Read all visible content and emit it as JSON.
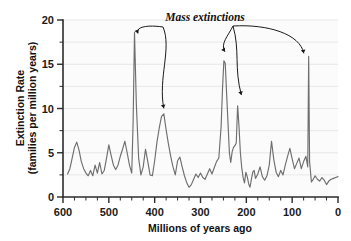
{
  "chart_data": {
    "type": "line",
    "title": "",
    "xlabel": "Millions of years ago",
    "ylabel": "Extinction Rate\n(families per million years)",
    "ylabel_line1": "Extinction Rate",
    "ylabel_line2": "(families per million years)",
    "xlim": [
      600,
      0
    ],
    "ylim": [
      0,
      20
    ],
    "x_reversed": true,
    "grid": "horizontal-minor",
    "legend": "none",
    "x_ticks_major": [
      600,
      500,
      400,
      300,
      200,
      100,
      0
    ],
    "x_tick_labels": [
      "600",
      "500",
      "400",
      "300",
      "200",
      "100",
      "0"
    ],
    "x_tick_minor_step": 25,
    "y_ticks_major": [
      0,
      5,
      10,
      15,
      20
    ],
    "y_tick_labels": [
      "0",
      "5",
      "10",
      "15",
      "20"
    ],
    "y_tick_minor_step": 2.5,
    "series_name": "Extinction rate",
    "line_color": "#6e6e6e",
    "x": [
      590,
      585,
      580,
      575,
      570,
      565,
      560,
      555,
      550,
      545,
      540,
      535,
      530,
      525,
      520,
      515,
      510,
      505,
      500,
      495,
      490,
      485,
      480,
      475,
      470,
      465,
      460,
      455,
      450,
      447,
      444,
      440,
      435,
      430,
      425,
      420,
      415,
      410,
      405,
      400,
      395,
      390,
      385,
      380,
      375,
      370,
      365,
      360,
      355,
      350,
      345,
      340,
      335,
      330,
      325,
      320,
      315,
      310,
      305,
      300,
      295,
      290,
      285,
      280,
      275,
      270,
      265,
      260,
      255,
      252,
      249,
      246,
      243,
      240,
      237,
      234,
      231,
      228,
      225,
      222,
      219,
      216,
      213,
      210,
      207,
      204,
      201,
      198,
      195,
      192,
      189,
      186,
      183,
      180,
      175,
      170,
      165,
      160,
      155,
      150,
      145,
      140,
      135,
      130,
      125,
      120,
      115,
      110,
      105,
      100,
      95,
      90,
      85,
      80,
      75,
      70,
      66,
      64,
      62,
      58,
      54,
      50,
      45,
      40,
      35,
      30,
      25,
      20,
      15,
      10,
      5,
      0
    ],
    "y": [
      2.6,
      3.2,
      4.4,
      5.6,
      6.2,
      5.3,
      4.0,
      3.2,
      2.7,
      2.4,
      3.0,
      2.4,
      3.6,
      2.7,
      3.9,
      2.6,
      3.0,
      4.4,
      5.9,
      4.7,
      3.6,
      3.1,
      3.6,
      4.6,
      5.4,
      6.3,
      5.0,
      3.6,
      2.7,
      8.5,
      18.6,
      10.5,
      4.4,
      2.5,
      3.4,
      5.4,
      4.0,
      2.5,
      2.4,
      4.1,
      6.2,
      7.8,
      9.1,
      9.4,
      7.6,
      6.0,
      4.6,
      3.4,
      2.5,
      4.1,
      4.5,
      3.4,
      2.4,
      1.6,
      1.1,
      1.4,
      2.0,
      2.6,
      2.2,
      2.7,
      2.2,
      2.0,
      2.6,
      3.2,
      2.6,
      3.3,
      4.0,
      4.4,
      8.0,
      12.2,
      15.4,
      15.1,
      11.6,
      8.4,
      5.0,
      3.9,
      5.1,
      5.6,
      5.8,
      6.1,
      10.3,
      8.0,
      5.0,
      3.3,
      2.2,
      1.6,
      2.8,
      2.3,
      1.5,
      1.1,
      2.0,
      2.8,
      3.0,
      2.1,
      2.6,
      3.4,
      2.3,
      1.9,
      2.4,
      3.6,
      6.3,
      4.2,
      2.8,
      2.3,
      3.0,
      2.5,
      3.6,
      4.6,
      5.5,
      4.3,
      3.2,
      3.8,
      4.4,
      3.2,
      4.0,
      4.6,
      3.4,
      15.9,
      4.0,
      1.7,
      2.0,
      2.4,
      2.0,
      1.8,
      2.2,
      1.9,
      1.4,
      1.8,
      2.0,
      2.1,
      2.2,
      2.3
    ],
    "annotations": [
      {
        "label": "Mass extinctions",
        "points_to": [
          {
            "name": "ordovician",
            "x": 444,
            "y": 18.6
          },
          {
            "name": "devonian",
            "x": 378,
            "y": 9.4
          },
          {
            "name": "permian",
            "x": 251,
            "y": 15.8
          },
          {
            "name": "triassic",
            "x": 213,
            "y": 10.9
          },
          {
            "name": "cretaceous",
            "x": 66,
            "y": 15.9
          }
        ]
      }
    ]
  },
  "annotation_text": "Mass extinctions"
}
